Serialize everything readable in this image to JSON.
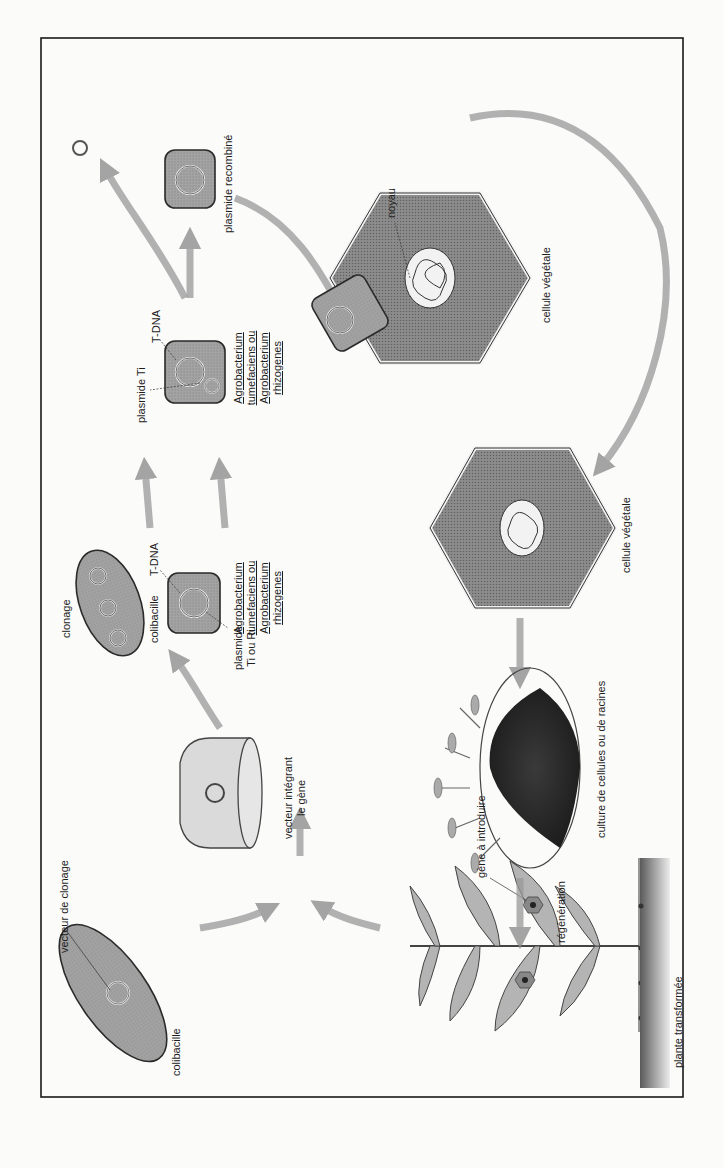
{
  "figure": {
    "orientation": "rotated 90° counter-clockwise (text reads bottom-to-top)",
    "colors": {
      "frame": "#1a1a1a",
      "bacterium_fill": "#9a9a9a",
      "bacterium_outline": "#2a2a2a",
      "arrow": "#8c8c8c",
      "plant_cell_fill": "#8f8f8f",
      "vector_fill": "#d8d8d8",
      "leaf_fill": "#b4b4b4",
      "soil": "#6e6e6e",
      "culture": "#2e2e2e"
    },
    "labels": {
      "vecteur_de_clonage": "vecteur de clonage",
      "colibacille_start": "colibacille",
      "gene_a_introduire": "gène à introduire",
      "vecteur_integrant_le_gene": [
        "vecteur intégrant",
        "le gène"
      ],
      "clonage": "clonage",
      "colibacille_clonage": "colibacille",
      "plasmide_ti_ou_ri": [
        "plasmide",
        "Ti ou Ri"
      ],
      "t_dna_1": "T-DNA",
      "species_1": [
        "Agrobacterium",
        "tumefaciens ou",
        "Agrobacterium",
        "rhizogenes"
      ],
      "plasmide_ti": "plasmide Ti",
      "t_dna_2": "T-DNA",
      "species_2": [
        "Agrobacterium",
        "tumefaciens ou",
        "Agrobacterium",
        "rhizogenes"
      ],
      "plasmide_recombine": "plasmide recombiné",
      "noyau": "noyau",
      "cellule_vegetale_1": "cellule végétale",
      "cellule_vegetale_2": "cellule végétale",
      "culture": "culture de cellules ou de racines",
      "regeneration": "régénération",
      "plante_transformee": "plante transformée"
    },
    "steps": [
      "colibacille + vecteur de clonage",
      "plante source du gène à introduire",
      "vecteur intégrant le gène",
      "clonage dans colibacille",
      "Agrobacterium avec plasmide Ti ou Ri",
      "Agrobacterium avec plasmide Ti + vecteur",
      "plasmide recombiné",
      "infection de la cellule végétale",
      "cellule végétale transformée",
      "culture de cellules ou de racines",
      "régénération",
      "plante transformée"
    ]
  }
}
